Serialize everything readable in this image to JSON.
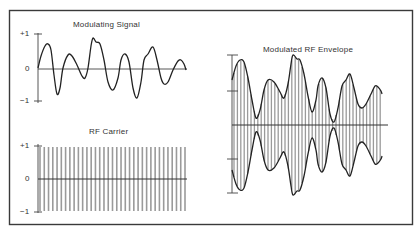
{
  "figure": {
    "border_color": "#3a3a3a",
    "line_color": "#222222",
    "carrier_color": "#9a9a9a"
  },
  "panels": {
    "modulating": {
      "title": "Modulating Signal",
      "ticks": {
        "top": "+1",
        "mid": "0",
        "bottom": "−1"
      },
      "points": [
        [
          38,
          68
        ],
        [
          41,
          56
        ],
        [
          45,
          46
        ],
        [
          48,
          44
        ],
        [
          51,
          50
        ],
        [
          54,
          75
        ],
        [
          57,
          94
        ],
        [
          60,
          88
        ],
        [
          63,
          68
        ],
        [
          68,
          55
        ],
        [
          72,
          56
        ],
        [
          77,
          65
        ],
        [
          82,
          76
        ],
        [
          85,
          78
        ],
        [
          88,
          68
        ],
        [
          91,
          46
        ],
        [
          93,
          38
        ],
        [
          96,
          42
        ],
        [
          100,
          44
        ],
        [
          104,
          60
        ],
        [
          108,
          82
        ],
        [
          113,
          90
        ],
        [
          118,
          78
        ],
        [
          121,
          60
        ],
        [
          125,
          54
        ],
        [
          129,
          62
        ],
        [
          133,
          88
        ],
        [
          137,
          98
        ],
        [
          141,
          82
        ],
        [
          144,
          60
        ],
        [
          148,
          54
        ],
        [
          153,
          47
        ],
        [
          157,
          60
        ],
        [
          161,
          78
        ],
        [
          164,
          84
        ],
        [
          168,
          82
        ],
        [
          173,
          70
        ],
        [
          178,
          61
        ],
        [
          181,
          60
        ],
        [
          184,
          64
        ],
        [
          186,
          70
        ]
      ]
    },
    "carrier": {
      "title": "RF Carrier",
      "ticks": {
        "top": "+1",
        "mid": "0",
        "bottom": "−1"
      },
      "cycles": 34
    },
    "envelope": {
      "title": "Modulated RF Envelope",
      "upper": [
        [
          232,
          80
        ],
        [
          236,
          66
        ],
        [
          240,
          60
        ],
        [
          244,
          62
        ],
        [
          248,
          78
        ],
        [
          252,
          100
        ],
        [
          256,
          118
        ],
        [
          260,
          110
        ],
        [
          264,
          90
        ],
        [
          268,
          80
        ],
        [
          274,
          82
        ],
        [
          280,
          92
        ],
        [
          284,
          98
        ],
        [
          288,
          84
        ],
        [
          291,
          64
        ],
        [
          293,
          55
        ],
        [
          297,
          59
        ],
        [
          300,
          60
        ],
        [
          304,
          74
        ],
        [
          308,
          96
        ],
        [
          312,
          112
        ],
        [
          316,
          100
        ],
        [
          318,
          86
        ],
        [
          322,
          78
        ],
        [
          326,
          88
        ],
        [
          330,
          114
        ],
        [
          334,
          122
        ],
        [
          338,
          108
        ],
        [
          342,
          86
        ],
        [
          346,
          80
        ],
        [
          350,
          74
        ],
        [
          354,
          88
        ],
        [
          358,
          104
        ],
        [
          362,
          108
        ],
        [
          366,
          104
        ],
        [
          371,
          94
        ],
        [
          375,
          86
        ],
        [
          378,
          87
        ],
        [
          381,
          91
        ],
        [
          382,
          94
        ]
      ]
    }
  }
}
